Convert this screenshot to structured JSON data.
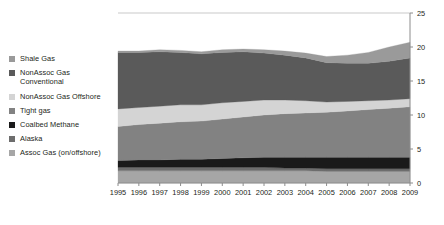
{
  "chart_data": {
    "type": "area",
    "stacked": true,
    "title": "",
    "subtitle": "",
    "xlabel": "",
    "ylabel": "",
    "categories": [
      "1995",
      "1996",
      "1997",
      "1998",
      "1999",
      "2000",
      "2001",
      "2002",
      "2003",
      "2004",
      "2005",
      "2006",
      "2007",
      "2008",
      "2009"
    ],
    "x": [
      1995,
      1996,
      1997,
      1998,
      1999,
      2000,
      2001,
      2002,
      2003,
      2004,
      2005,
      2006,
      2007,
      2008,
      2009
    ],
    "ylim": [
      0,
      25
    ],
    "y_ticks": [
      "0",
      "5",
      "10",
      "15",
      "20",
      "25"
    ],
    "y_tick_values": [
      0,
      5,
      10,
      15,
      20,
      25
    ],
    "y_axis_position": "right",
    "grid": false,
    "legend_position": "left",
    "stack_order_bottom_to_top": [
      "Assoc Gas (on/offshore)",
      "Alaska",
      "Coalbed Methane",
      "Tight gas",
      "NonAssoc Gas Offshore",
      "NonAssoc Gas Conventional",
      "Shale Gas"
    ],
    "series": [
      {
        "name": "Assoc Gas (on/offshore)",
        "color": "#a6a6a6",
        "values": [
          1.8,
          1.8,
          1.8,
          1.8,
          1.8,
          1.8,
          1.8,
          1.8,
          1.8,
          1.8,
          1.7,
          1.7,
          1.7,
          1.7,
          1.7
        ]
      },
      {
        "name": "Alaska",
        "color": "#6d6d6d",
        "values": [
          0.5,
          0.5,
          0.5,
          0.5,
          0.5,
          0.5,
          0.5,
          0.5,
          0.4,
          0.4,
          0.4,
          0.4,
          0.4,
          0.4,
          0.4
        ]
      },
      {
        "name": "Coalbed Methane",
        "color": "#1a1a1a",
        "values": [
          1.0,
          1.1,
          1.1,
          1.2,
          1.2,
          1.3,
          1.4,
          1.5,
          1.6,
          1.6,
          1.7,
          1.7,
          1.7,
          1.7,
          1.7
        ]
      },
      {
        "name": "Tight gas",
        "color": "#828282",
        "values": [
          5.0,
          5.2,
          5.4,
          5.5,
          5.6,
          5.8,
          6.0,
          6.2,
          6.4,
          6.5,
          6.6,
          6.8,
          7.0,
          7.2,
          7.4
        ]
      },
      {
        "name": "NonAssoc Gas Offshore",
        "color": "#d4d4d4",
        "values": [
          2.6,
          2.5,
          2.5,
          2.5,
          2.4,
          2.4,
          2.3,
          2.2,
          2.0,
          1.8,
          1.5,
          1.4,
          1.3,
          1.2,
          1.2
        ]
      },
      {
        "name": "NonAssoc Gas Conventional",
        "color": "#5a5a5a",
        "values": [
          8.3,
          8.1,
          8.0,
          7.7,
          7.5,
          7.4,
          7.3,
          6.9,
          6.6,
          6.3,
          5.8,
          5.6,
          5.5,
          5.7,
          6.0
        ]
      },
      {
        "name": "Shale Gas",
        "color": "#9a9a9a",
        "values": [
          0.2,
          0.2,
          0.3,
          0.3,
          0.3,
          0.4,
          0.4,
          0.5,
          0.6,
          0.7,
          0.9,
          1.2,
          1.6,
          2.1,
          2.3
        ]
      }
    ],
    "totals": [
      19.4,
      19.4,
      19.6,
      19.5,
      19.3,
      19.6,
      19.7,
      19.6,
      19.4,
      19.1,
      18.6,
      18.8,
      19.2,
      20.0,
      20.7
    ]
  },
  "legend": {
    "items": [
      {
        "label": "Shale Gas",
        "color": "#9a9a9a"
      },
      {
        "label": "NonAssoc Gas\nConventional",
        "color": "#5a5a5a"
      },
      {
        "label": "NonAssoc Gas Offshore",
        "color": "#d4d4d4"
      },
      {
        "label": "Tight gas",
        "color": "#828282"
      },
      {
        "label": "Coalbed Methane",
        "color": "#1a1a1a"
      },
      {
        "label": "Alaska",
        "color": "#6d6d6d"
      },
      {
        "label": "Assoc Gas (on/offshore)",
        "color": "#a6a6a6"
      }
    ]
  },
  "axes": {
    "top_rule_color": "#c9c9c9",
    "axis_line_color": "#8c8c8c",
    "tick_text_color": "#231f20"
  }
}
